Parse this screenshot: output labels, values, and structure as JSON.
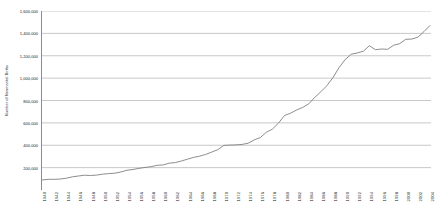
{
  "chart_data": {
    "type": "line",
    "title": "",
    "xlabel": "",
    "ylabel": "Number of Nonmarital Births",
    "ylim": [
      0,
      1600000
    ],
    "xlim": [
      1940,
      2004
    ],
    "grid": true,
    "legend": false,
    "y_ticks": [
      "200,000",
      "400,000",
      "600,000",
      "800,000",
      "1,000,000",
      "1,200,000",
      "1,400,000",
      "1,600,000"
    ],
    "y_tick_values": [
      200000,
      400000,
      600000,
      800000,
      1000000,
      1200000,
      1400000,
      1600000
    ],
    "x_tick_labels": [
      "1940",
      "1942",
      "1944",
      "1946",
      "1948",
      "1950",
      "1952",
      "1954",
      "1956",
      "1958",
      "1960",
      "1962",
      "1964",
      "1966",
      "1968",
      "1970",
      "1972",
      "1974",
      "1976",
      "1978",
      "1980",
      "1982",
      "1984",
      "1986",
      "1988",
      "1990",
      "1992",
      "1994",
      "1996",
      "1998",
      "2000",
      "2002",
      "2004"
    ],
    "series": [
      {
        "name": "Nonmarital Births",
        "color": "#808080",
        "x": [
          1940,
          1941,
          1942,
          1943,
          1944,
          1945,
          1946,
          1947,
          1948,
          1949,
          1950,
          1951,
          1952,
          1953,
          1954,
          1955,
          1956,
          1957,
          1958,
          1959,
          1960,
          1961,
          1962,
          1963,
          1964,
          1965,
          1966,
          1967,
          1968,
          1969,
          1970,
          1971,
          1972,
          1973,
          1974,
          1975,
          1976,
          1977,
          1978,
          1979,
          1980,
          1981,
          1982,
          1983,
          1984,
          1985,
          1986,
          1987,
          1988,
          1989,
          1990,
          1991,
          1992,
          1993,
          1994,
          1995,
          1996,
          1997,
          1998,
          1999,
          2000,
          2001,
          2002,
          2003,
          2004
        ],
        "values": [
          89500,
          95700,
          95500,
          98100,
          105200,
          117400,
          125200,
          131900,
          129700,
          133200,
          141600,
          146500,
          150300,
          160800,
          176600,
          183300,
          193500,
          201700,
          208700,
          220600,
          224300,
          240200,
          245100,
          259400,
          275700,
          291200,
          302400,
          318100,
          339200,
          360800,
          398700,
          401400,
          403200,
          407300,
          418100,
          447900,
          468100,
          515700,
          543900,
          597800,
          665747,
          686605,
          715227,
          737893,
          770355,
          828174,
          878477,
          933013,
          1005299,
          1094169,
          1165384,
          1213769,
          1224876,
          1240172,
          1289592,
          1253976,
          1260306,
          1257444,
          1293567,
          1308560,
          1347043,
          1349249,
          1365966,
          1415995,
          1470189
        ]
      }
    ]
  }
}
